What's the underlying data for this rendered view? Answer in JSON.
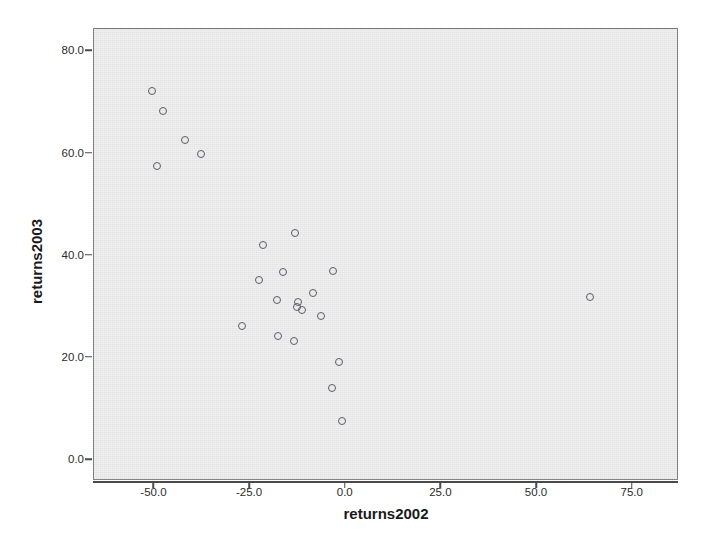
{
  "chart_data": {
    "type": "scatter",
    "title": "",
    "xlabel": "returns2002",
    "ylabel": "returns2003",
    "xlim": [
      -65.8,
      87.1
    ],
    "ylim": [
      -4.1,
      84.4
    ],
    "grid": false,
    "legend": "none",
    "xticks": [
      "-50.0",
      "-25.0",
      "0.0",
      "25.0",
      "50.0",
      "75.0"
    ],
    "xtick_values": [
      -50.0,
      -25.0,
      0.0,
      25.0,
      50.0,
      75.0
    ],
    "yticks": [
      "0.0",
      "20.0",
      "40.0",
      "60.0",
      "80.0"
    ],
    "ytick_values": [
      0.0,
      20.0,
      40.0,
      60.0,
      80.0
    ],
    "marker": "open-circle",
    "marker_color": "#5c5c6a",
    "plot_background": "#ebebeb",
    "n_points": 25,
    "points": [
      {
        "x": -50.3,
        "y": 72.0
      },
      {
        "x": -47.4,
        "y": 68.1
      },
      {
        "x": -41.8,
        "y": 62.4
      },
      {
        "x": -37.6,
        "y": 59.8
      },
      {
        "x": -49.2,
        "y": 57.3
      },
      {
        "x": -12.9,
        "y": 44.2
      },
      {
        "x": -21.3,
        "y": 42.0
      },
      {
        "x": -16.1,
        "y": 36.6
      },
      {
        "x": -3.2,
        "y": 36.8
      },
      {
        "x": -22.4,
        "y": 35.0
      },
      {
        "x": -8.2,
        "y": 32.6
      },
      {
        "x": 64.2,
        "y": 31.8
      },
      {
        "x": -17.6,
        "y": 31.1
      },
      {
        "x": -12.1,
        "y": 30.8
      },
      {
        "x": -12.6,
        "y": 29.8
      },
      {
        "x": -11.1,
        "y": 29.1
      },
      {
        "x": -6.3,
        "y": 28.0
      },
      {
        "x": -26.8,
        "y": 26.0
      },
      {
        "x": -17.4,
        "y": 24.0
      },
      {
        "x": -13.2,
        "y": 23.1
      },
      {
        "x": -1.6,
        "y": 19.1
      },
      {
        "x": -3.4,
        "y": 13.9
      },
      {
        "x": -0.8,
        "y": 7.4
      }
    ]
  },
  "axes": {
    "y_title": "returns2003",
    "x_title": "returns2002"
  }
}
